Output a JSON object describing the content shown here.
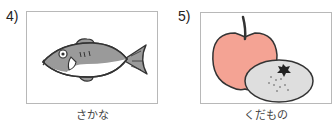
{
  "items": [
    {
      "number": "4)",
      "caption": "さかな",
      "picture": "fish-illustration"
    },
    {
      "number": "5)",
      "caption": "くだもの",
      "picture": "apple-and-mandarin-illustration"
    }
  ],
  "colors": {
    "fish_body": "#9a9a9a",
    "fish_belly": "#ffffff",
    "apple": "#f4a394",
    "mandarin": "#dedede",
    "outline": "#333333",
    "box_border": "#b8b8b8"
  }
}
